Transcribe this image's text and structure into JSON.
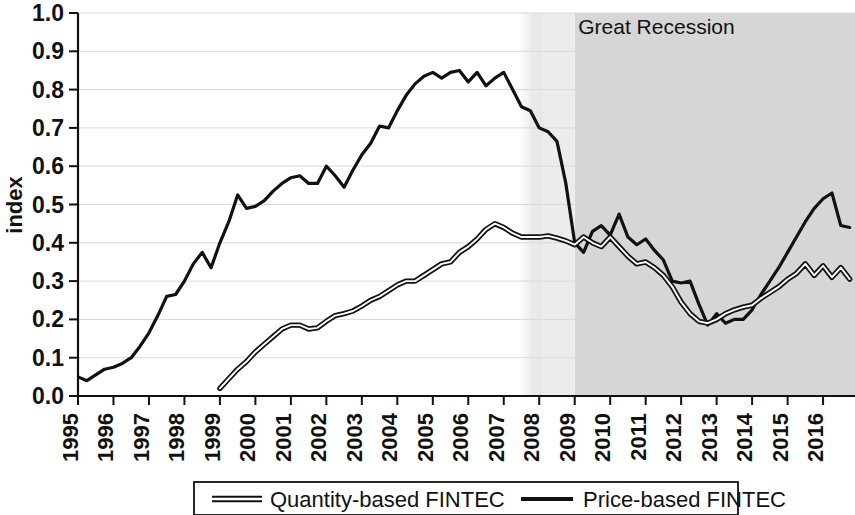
{
  "chart_data": {
    "type": "line",
    "title": "",
    "xlabel": "",
    "ylabel": "index",
    "ylim": [
      0.0,
      1.0
    ],
    "xlim": [
      1995.0,
      2016.9
    ],
    "grid": true,
    "y_ticks": [
      "0.0",
      "0.1",
      "0.2",
      "0.3",
      "0.4",
      "0.5",
      "0.6",
      "0.7",
      "0.8",
      "0.9",
      "1.0"
    ],
    "y_tick_values": [
      0.0,
      0.1,
      0.2,
      0.3,
      0.4,
      0.5,
      0.6,
      0.7,
      0.8,
      0.9,
      1.0
    ],
    "x_ticks": [
      "1995",
      "1996",
      "1997",
      "1998",
      "1999",
      "2000",
      "2001",
      "2002",
      "2003",
      "2004",
      "2005",
      "2006",
      "2007",
      "2008",
      "2009",
      "2010",
      "2011",
      "2012",
      "2013",
      "2014",
      "2015",
      "2016"
    ],
    "x_tick_values": [
      1995,
      1996,
      1997,
      1998,
      1999,
      2000,
      2001,
      2002,
      2003,
      2004,
      2005,
      2006,
      2007,
      2008,
      2009,
      2010,
      2011,
      2012,
      2013,
      2014,
      2015,
      2016
    ],
    "legend_position": "bottom",
    "series": [
      {
        "name": "Quantity-based FINTEC",
        "style": "hollow-double-line",
        "color": "#111111",
        "x": [
          1999.0,
          1999.25,
          1999.5,
          1999.75,
          2000.0,
          2000.25,
          2000.5,
          2000.75,
          2001.0,
          2001.25,
          2001.5,
          2001.75,
          2002.0,
          2002.25,
          2002.5,
          2002.75,
          2003.0,
          2003.25,
          2003.5,
          2003.75,
          2004.0,
          2004.25,
          2004.5,
          2004.75,
          2005.0,
          2005.25,
          2005.5,
          2005.75,
          2006.0,
          2006.25,
          2006.5,
          2006.75,
          2007.0,
          2007.25,
          2007.5,
          2007.75,
          2008.0,
          2008.25,
          2008.5,
          2008.75,
          2009.0,
          2009.25,
          2009.5,
          2009.75,
          2010.0,
          2010.25,
          2010.5,
          2010.75,
          2011.0,
          2011.25,
          2011.5,
          2011.75,
          2012.0,
          2012.25,
          2012.5,
          2012.75,
          2013.0,
          2013.25,
          2013.5,
          2013.75,
          2014.0,
          2014.25,
          2014.5,
          2014.75,
          2015.0,
          2015.25,
          2015.5,
          2015.75,
          2016.0,
          2016.25,
          2016.5,
          2016.75
        ],
        "y": [
          0.02,
          0.045,
          0.07,
          0.09,
          0.115,
          0.135,
          0.155,
          0.175,
          0.185,
          0.185,
          0.175,
          0.178,
          0.195,
          0.21,
          0.215,
          0.222,
          0.235,
          0.25,
          0.26,
          0.275,
          0.29,
          0.3,
          0.3,
          0.315,
          0.33,
          0.345,
          0.35,
          0.375,
          0.39,
          0.41,
          0.435,
          0.45,
          0.44,
          0.425,
          0.415,
          0.415,
          0.415,
          0.418,
          0.412,
          0.405,
          0.395,
          0.415,
          0.4,
          0.39,
          0.415,
          0.39,
          0.365,
          0.345,
          0.35,
          0.335,
          0.315,
          0.285,
          0.245,
          0.215,
          0.195,
          0.19,
          0.2,
          0.215,
          0.225,
          0.232,
          0.237,
          0.255,
          0.27,
          0.285,
          0.305,
          0.32,
          0.345,
          0.315,
          0.34,
          0.31,
          0.335,
          0.305
        ]
      },
      {
        "name": "Price-based FINTEC",
        "style": "solid-line",
        "color": "#111111",
        "x": [
          1995.0,
          1995.25,
          1995.5,
          1995.75,
          1996.0,
          1996.25,
          1996.5,
          1996.75,
          1997.0,
          1997.25,
          1997.5,
          1997.75,
          1998.0,
          1998.25,
          1998.5,
          1998.75,
          1999.0,
          1999.25,
          1999.5,
          1999.75,
          2000.0,
          2000.25,
          2000.5,
          2000.75,
          2001.0,
          2001.25,
          2001.5,
          2001.75,
          2002.0,
          2002.25,
          2002.5,
          2002.75,
          2003.0,
          2003.25,
          2003.5,
          2003.75,
          2004.0,
          2004.25,
          2004.5,
          2004.75,
          2005.0,
          2005.25,
          2005.5,
          2005.75,
          2006.0,
          2006.25,
          2006.5,
          2006.75,
          2007.0,
          2007.25,
          2007.5,
          2007.75,
          2008.0,
          2008.25,
          2008.5,
          2008.75,
          2009.0,
          2009.25,
          2009.5,
          2009.75,
          2010.0,
          2010.25,
          2010.5,
          2010.75,
          2011.0,
          2011.25,
          2011.5,
          2011.75,
          2012.0,
          2012.25,
          2012.5,
          2012.75,
          2013.0,
          2013.25,
          2013.5,
          2013.75,
          2014.0,
          2014.25,
          2014.5,
          2014.75,
          2015.0,
          2015.25,
          2015.5,
          2015.75,
          2016.0,
          2016.25,
          2016.5,
          2016.75
        ],
        "y": [
          0.05,
          0.04,
          0.055,
          0.07,
          0.075,
          0.085,
          0.1,
          0.13,
          0.165,
          0.21,
          0.26,
          0.265,
          0.3,
          0.345,
          0.375,
          0.335,
          0.4,
          0.455,
          0.525,
          0.49,
          0.495,
          0.51,
          0.535,
          0.555,
          0.57,
          0.575,
          0.555,
          0.555,
          0.6,
          0.575,
          0.545,
          0.59,
          0.63,
          0.66,
          0.705,
          0.7,
          0.745,
          0.785,
          0.815,
          0.835,
          0.845,
          0.83,
          0.845,
          0.85,
          0.82,
          0.845,
          0.81,
          0.83,
          0.845,
          0.8,
          0.755,
          0.745,
          0.7,
          0.69,
          0.665,
          0.555,
          0.4,
          0.375,
          0.43,
          0.445,
          0.42,
          0.475,
          0.415,
          0.395,
          0.41,
          0.38,
          0.355,
          0.3,
          0.295,
          0.3,
          0.24,
          0.185,
          0.215,
          0.19,
          0.2,
          0.2,
          0.225,
          0.265,
          0.3,
          0.335,
          0.375,
          0.415,
          0.455,
          0.49,
          0.515,
          0.53,
          0.445,
          0.44
        ]
      }
    ],
    "annotations": [
      {
        "name": "great-recession",
        "label": "Great Recession",
        "type": "shaded-band",
        "x_start": 2007.75,
        "x_end": 2016.9,
        "fade_end": 2009.0,
        "fill_light": "#ececec",
        "fill_dark": "#d6d6d6",
        "label_x": 2009.1,
        "label_y": 0.945
      }
    ]
  },
  "legend": {
    "items": [
      {
        "label": "Quantity-based FINTEC",
        "swatch": "hollow-double-line"
      },
      {
        "label": "Price-based FINTEC",
        "swatch": "solid-line"
      }
    ]
  },
  "colors": {
    "line": "#111111",
    "grid": "#d9d9d9",
    "axis": "#111111",
    "band_light": "#ececec",
    "band_dark": "#d6d6d6",
    "background": "#ffffff"
  }
}
